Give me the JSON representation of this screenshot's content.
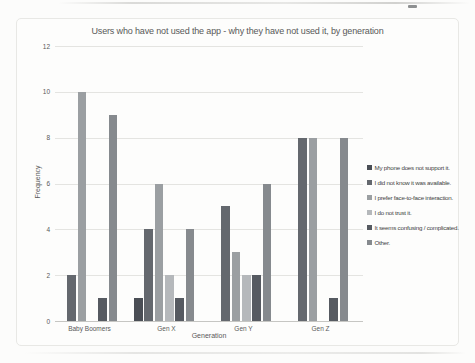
{
  "chart_data": {
    "type": "bar",
    "title": "Users who have not used the app - why they have not used it, by generation",
    "xlabel": "Generation",
    "ylabel": "Frequency",
    "ylim": [
      0,
      12
    ],
    "yticks": [
      0,
      2,
      4,
      6,
      8,
      10,
      12
    ],
    "grid": true,
    "legend_position": "right",
    "categories": [
      "Baby Boomers",
      "Gen X",
      "Gen Y",
      "Gen Z"
    ],
    "series": [
      {
        "name": "My phone does not support it.",
        "color": "#4a4e55",
        "values": [
          0,
          1,
          0,
          0
        ]
      },
      {
        "name": "I did not know it was available.",
        "color": "#64686e",
        "values": [
          2,
          4,
          5,
          8
        ]
      },
      {
        "name": "I prefer face-to-face interaction.",
        "color": "#9b9fa2",
        "values": [
          10,
          6,
          3,
          8
        ]
      },
      {
        "name": "I do not trust it.",
        "color": "#b5b8bb",
        "values": [
          0,
          2,
          2,
          0
        ]
      },
      {
        "name": "It seems confusing / complicated.",
        "color": "#565a61",
        "values": [
          1,
          1,
          2,
          1
        ]
      },
      {
        "name": "Other.",
        "color": "#868a8e",
        "values": [
          9,
          4,
          6,
          8
        ]
      }
    ]
  }
}
